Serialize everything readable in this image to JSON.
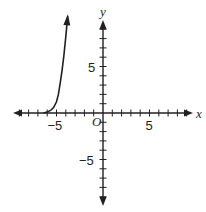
{
  "chart_data": {
    "type": "line",
    "title": "",
    "xlabel": "x",
    "ylabel": "y",
    "origin_label": "O",
    "xlim": [
      -9.5,
      9.5
    ],
    "ylim": [
      -9.5,
      9.5
    ],
    "x_tick_labels": [
      {
        "value": -5,
        "text": "−5"
      },
      {
        "value": 5,
        "text": "5"
      }
    ],
    "y_tick_labels": [
      {
        "value": 5,
        "text": "5"
      },
      {
        "value": -5,
        "text": "−5"
      }
    ],
    "ticks_every": 1,
    "grid": false,
    "series": [
      {
        "name": "curve",
        "color": "#231f20",
        "arrow_end": true,
        "x": [
          -6.4,
          -6.0,
          -5.6,
          -5.3,
          -5.0,
          -4.8,
          -4.6,
          -4.4,
          -4.2,
          -4.0,
          -3.8
        ],
        "y": [
          0.0,
          0.1,
          0.3,
          0.6,
          1.2,
          2.0,
          3.2,
          4.6,
          6.2,
          8.2,
          10.4
        ]
      }
    ]
  },
  "style": {
    "axis_color": "#231f20",
    "curve_color": "#231f20"
  }
}
